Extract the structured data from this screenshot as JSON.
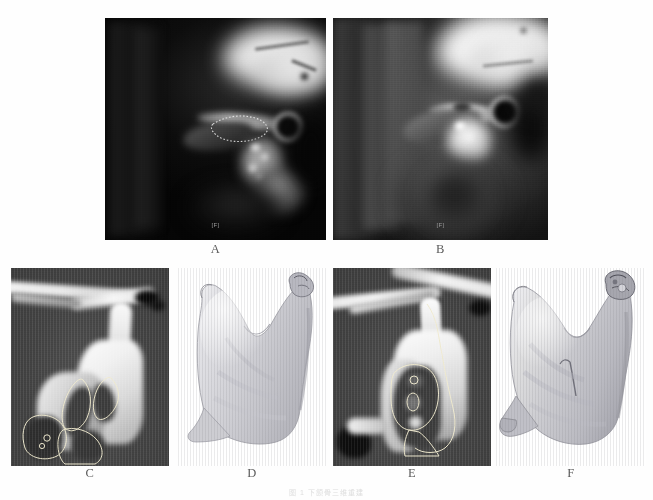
{
  "figure": {
    "background_color": "#ffffff",
    "panel_label_color": "#5a5a5a",
    "rows": 2,
    "columns_top": 2,
    "columns_bottom": 4
  },
  "panels": [
    {
      "id": "A",
      "label": "A",
      "modality": "MRI",
      "description": "Sagittal T1-weighted MRI of the temporomandibular joint, dark background, dotted outline over the condyle region",
      "orientation_marker": "[F]",
      "background_color": "#000000",
      "has_dotted_contour": true
    },
    {
      "id": "B",
      "label": "B",
      "modality": "MRI",
      "description": "Sagittal proton-density MRI of the temporomandibular joint, brighter soft-tissue contrast",
      "orientation_marker": "[F]",
      "background_color": "#1a1a1a",
      "has_dotted_contour": false
    },
    {
      "id": "C",
      "label": "C",
      "modality": "CT",
      "description": "Sagittal CT slice of the left mandibular ramus with segmentation contour outlining the marrow cavity",
      "background_color": "#464646",
      "has_segmentation_contour": true,
      "contour_color": "#e8e2c8"
    },
    {
      "id": "D",
      "label": "D",
      "modality": "3D surface reconstruction",
      "description": "Three-dimensional surface rendering of the segmented left mandibular ramus and condyle",
      "background_color": "#ffffff",
      "surface_color": "#d3d3d6"
    },
    {
      "id": "E",
      "label": "E",
      "modality": "CT",
      "description": "Sagittal CT slice of the contralateral mandibular ramus with segmentation contour",
      "background_color": "#464646",
      "has_segmentation_contour": true,
      "contour_color": "#e8e2c8"
    },
    {
      "id": "F",
      "label": "F",
      "modality": "3D surface reconstruction",
      "description": "Three-dimensional surface rendering of the contralateral mandibular ramus and condyle",
      "background_color": "#ffffff",
      "surface_color": "#cfcfd2"
    }
  ],
  "caption": {
    "text": "图 1  下颌骨三维重建"
  }
}
